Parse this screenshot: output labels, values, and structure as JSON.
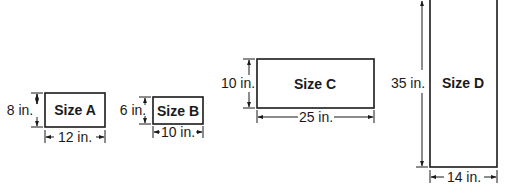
{
  "diagram": {
    "type": "dimensioned-rectangles",
    "shapes": [
      {
        "name": "Size A",
        "height_label": "8 in.",
        "width_label": "12 in.",
        "height_in": 8,
        "width_in": 12
      },
      {
        "name": "Size B",
        "height_label": "6 in.",
        "width_label": "10 in.",
        "height_in": 6,
        "width_in": 10
      },
      {
        "name": "Size C",
        "height_label": "10 in.",
        "width_label": "25 in.",
        "height_in": 10,
        "width_in": 25
      },
      {
        "name": "Size D",
        "height_label": "35 in.",
        "width_label": "14 in.",
        "height_in": 35,
        "width_in": 14
      }
    ]
  },
  "colors": {
    "stroke": "#1a1a1a",
    "background": "#ffffff"
  }
}
